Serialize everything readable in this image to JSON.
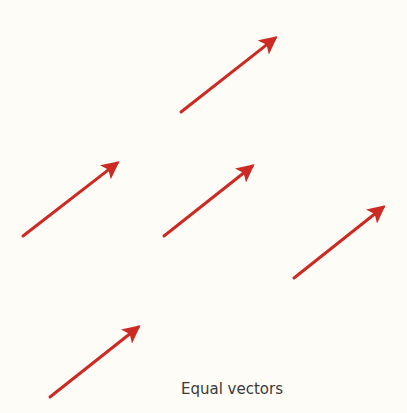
{
  "caption": "Equal vectors",
  "colors": {
    "background": "#fdfcf7",
    "arrow": "#cc2a22",
    "caption": "#3a3a3a"
  },
  "vectors": [
    {
      "name": "vector-1",
      "tail": [
        181,
        112
      ],
      "head": [
        283,
        32
      ]
    },
    {
      "name": "vector-2",
      "tail": [
        23,
        236
      ],
      "head": [
        125,
        157
      ]
    },
    {
      "name": "vector-3",
      "tail": [
        164,
        236
      ],
      "head": [
        260,
        160
      ]
    },
    {
      "name": "vector-4",
      "tail": [
        294,
        278
      ],
      "head": [
        391,
        201
      ]
    },
    {
      "name": "vector-5",
      "tail": [
        50,
        397
      ],
      "head": [
        146,
        321
      ]
    }
  ]
}
